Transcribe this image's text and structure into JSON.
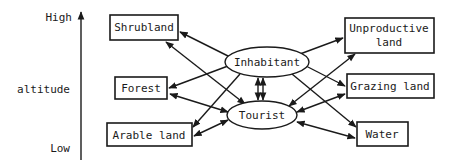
{
  "diagram": {
    "axis": {
      "top_label": "High",
      "middle_label": "altitude",
      "bottom_label": "Low"
    },
    "actors": {
      "inhabitant": "Inhabitant",
      "tourist": "Tourist"
    },
    "land_types_left": {
      "shrubland": "Shrubland",
      "forest": "Forest",
      "arable": "Arable land"
    },
    "land_types_right": {
      "unproductive_line1": "Unproductive",
      "unproductive_line2": "land",
      "grazing": "Grazing land",
      "water": "Water"
    },
    "edges": [
      {
        "from": "Inhabitant",
        "to": "Shrubland",
        "type": "one-way"
      },
      {
        "from": "Inhabitant",
        "to": "Forest",
        "type": "one-way"
      },
      {
        "from": "Inhabitant",
        "to": "Arable land",
        "type": "one-way"
      },
      {
        "from": "Inhabitant",
        "to": "Unproductive land",
        "type": "one-way"
      },
      {
        "from": "Inhabitant",
        "to": "Grazing land",
        "type": "one-way"
      },
      {
        "from": "Inhabitant",
        "to": "Water",
        "type": "one-way"
      },
      {
        "from": "Tourist",
        "to": "Shrubland",
        "type": "two-way"
      },
      {
        "from": "Tourist",
        "to": "Forest",
        "type": "two-way"
      },
      {
        "from": "Tourist",
        "to": "Arable land",
        "type": "two-way"
      },
      {
        "from": "Tourist",
        "to": "Unproductive land",
        "type": "two-way"
      },
      {
        "from": "Tourist",
        "to": "Grazing land",
        "type": "two-way"
      },
      {
        "from": "Tourist",
        "to": "Water",
        "type": "two-way"
      },
      {
        "from": "Inhabitant",
        "to": "Tourist",
        "type": "two-way-double"
      }
    ]
  }
}
